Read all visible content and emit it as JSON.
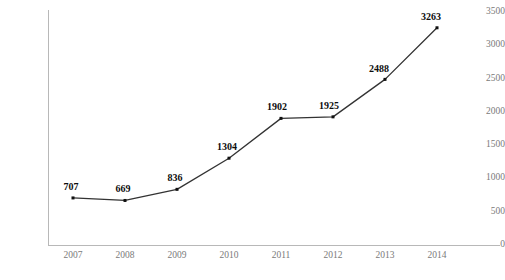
{
  "chart_data": {
    "type": "line",
    "title": "",
    "xlabel": "",
    "ylabel": "",
    "categories": [
      "2007",
      "2008",
      "2009",
      "2010",
      "2011",
      "2012",
      "2013",
      "2014"
    ],
    "values": [
      707,
      669,
      836,
      1304,
      1902,
      1925,
      2488,
      3263
    ],
    "series": [
      {
        "name": "",
        "values": [
          707,
          669,
          836,
          1304,
          1902,
          1925,
          2488,
          3263
        ]
      }
    ],
    "point_labels": [
      "707",
      "669",
      "836",
      "1304",
      "1902",
      "1925",
      "2488",
      "3263"
    ],
    "ylim": [
      0,
      3500
    ],
    "y_ticks": [
      0,
      500,
      1000,
      1500,
      2000,
      2500,
      3000,
      3500
    ],
    "y_tick_labels": [
      "0",
      "500",
      "1000",
      "1500",
      "2000",
      "2500",
      "3000",
      "3500"
    ],
    "x_tick_labels": [
      "2007",
      "2008",
      "2009",
      "2010",
      "2011",
      "2012",
      "2013",
      "2014"
    ],
    "grid": false,
    "legend": false,
    "legend_position": "none",
    "marker": "square",
    "line_color": "#333333",
    "marker_color": "#111111",
    "axis_color": "#b8b8b8",
    "tick_label_color": "#7a7a7a",
    "data_label_color": "#0d0d0d"
  },
  "footer": {
    "clipped_text": ""
  }
}
